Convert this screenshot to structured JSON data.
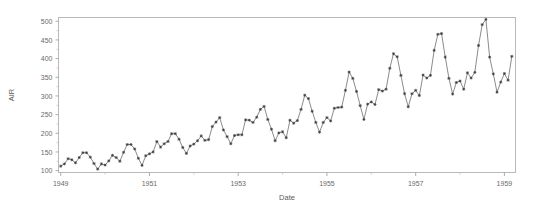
{
  "chart_title": "",
  "chart_data": {
    "type": "line",
    "title": "",
    "subtitle": "",
    "xlabel": "Date",
    "ylabel": "AIR",
    "xlim": [
      1948.95,
      1959.25
    ],
    "ylim": [
      95,
      510
    ],
    "grid": false,
    "legend": null,
    "marker": "star",
    "line_color": "#6d6d6d",
    "marker_color": "#3a3a3a",
    "frame_color": "#b9b9b9",
    "background": "#ffffff",
    "x_tick_labels": [
      "1949",
      "1951",
      "1953",
      "1955",
      "1957",
      "1959"
    ],
    "x_tick_values": [
      1949,
      1951,
      1953,
      1955,
      1957,
      1959
    ],
    "x_minor_ticks": [
      1950,
      1952,
      1954,
      1956,
      1958
    ],
    "y_tick_labels": [
      "100",
      "150",
      "200",
      "250",
      "300",
      "350",
      "400",
      "450",
      "500"
    ],
    "y_tick_values": [
      100,
      150,
      200,
      250,
      300,
      350,
      400,
      450,
      500
    ],
    "series": [
      {
        "name": "AIR",
        "x": [
          1949.0,
          1949.083,
          1949.167,
          1949.25,
          1949.333,
          1949.417,
          1949.5,
          1949.583,
          1949.667,
          1949.75,
          1949.833,
          1949.917,
          1950.0,
          1950.083,
          1950.167,
          1950.25,
          1950.333,
          1950.417,
          1950.5,
          1950.583,
          1950.667,
          1950.75,
          1950.833,
          1950.917,
          1951.0,
          1951.083,
          1951.167,
          1951.25,
          1951.333,
          1951.417,
          1951.5,
          1951.583,
          1951.667,
          1951.75,
          1951.833,
          1951.917,
          1952.0,
          1952.083,
          1952.167,
          1952.25,
          1952.333,
          1952.417,
          1952.5,
          1952.583,
          1952.667,
          1952.75,
          1952.833,
          1952.917,
          1953.0,
          1953.083,
          1953.167,
          1953.25,
          1953.333,
          1953.417,
          1953.5,
          1953.583,
          1953.667,
          1953.75,
          1953.833,
          1953.917,
          1954.0,
          1954.083,
          1954.167,
          1954.25,
          1954.333,
          1954.417,
          1954.5,
          1954.583,
          1954.667,
          1954.75,
          1954.833,
          1954.917,
          1955.0,
          1955.083,
          1955.167,
          1955.25,
          1955.333,
          1955.417,
          1955.5,
          1955.583,
          1955.667,
          1955.75,
          1955.833,
          1955.917,
          1956.0,
          1956.083,
          1956.167,
          1956.25,
          1956.333,
          1956.417,
          1956.5,
          1956.583,
          1956.667,
          1956.75,
          1956.833,
          1956.917,
          1957.0,
          1957.083,
          1957.167,
          1957.25,
          1957.333,
          1957.417,
          1957.5,
          1957.583,
          1957.667,
          1957.75,
          1957.833,
          1957.917,
          1958.0,
          1958.083,
          1958.167,
          1958.25,
          1958.333,
          1958.417,
          1958.5,
          1958.583,
          1958.667,
          1958.75,
          1958.833,
          1958.917,
          1959.0,
          1959.083,
          1959.167
        ],
        "values": [
          112,
          118,
          132,
          129,
          121,
          135,
          148,
          148,
          136,
          119,
          104,
          118,
          115,
          126,
          141,
          135,
          125,
          149,
          170,
          170,
          158,
          133,
          114,
          140,
          145,
          150,
          178,
          163,
          172,
          178,
          199,
          199,
          184,
          162,
          146,
          166,
          171,
          180,
          193,
          181,
          183,
          218,
          230,
          242,
          209,
          191,
          172,
          194,
          196,
          196,
          236,
          235,
          229,
          243,
          264,
          272,
          237,
          211,
          180,
          201,
          204,
          188,
          235,
          227,
          234,
          264,
          302,
          293,
          259,
          229,
          203,
          229,
          242,
          233,
          267,
          269,
          270,
          315,
          364,
          347,
          312,
          274,
          237,
          278,
          284,
          277,
          317,
          313,
          318,
          374,
          413,
          405,
          355,
          306,
          271,
          306,
          315,
          301,
          356,
          348,
          355,
          422,
          465,
          467,
          404,
          347,
          305,
          336,
          340,
          318,
          362,
          348,
          363,
          435,
          491,
          505,
          404,
          359,
          310,
          337,
          360,
          342,
          406
        ]
      }
    ]
  }
}
